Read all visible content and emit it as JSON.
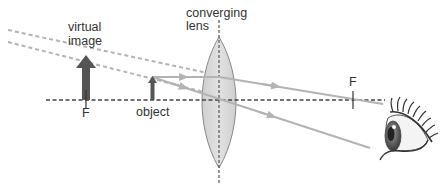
{
  "labels": {
    "virtual_image_line1": "virtual",
    "virtual_image_line2": "image",
    "lens_line1": "converging",
    "lens_line2": "lens",
    "object": "object",
    "focal_left": "F",
    "focal_right": "F"
  },
  "elements": {
    "optical_axis": "dashed horizontal principal axis",
    "lens": "biconvex converging lens",
    "object_arrow": "small upright object inside focal length",
    "virtual_image_arrow": "larger upright virtual image",
    "rays": [
      "parallel ray refracted through right focal point",
      "ray through lens center"
    ],
    "virtual_rays": [
      "dashed back-extension of refracted parallel ray",
      "dashed back-extension of central ray"
    ],
    "observer": "eye viewing through lens"
  },
  "colors": {
    "ray": "#b3b3b3",
    "virtual_ray": "#b3b3b3",
    "arrow": "#555555",
    "lens_fill": "#d9d9d9",
    "lens_stroke": "#888888",
    "axis": "#444444"
  }
}
